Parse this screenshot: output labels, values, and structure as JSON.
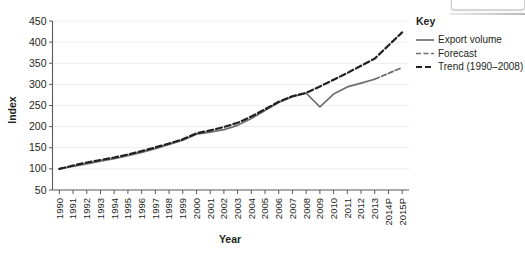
{
  "chart_data": {
    "type": "line",
    "title": "",
    "xlabel": "Year",
    "ylabel": "Index",
    "ylim": [
      50,
      450
    ],
    "yticks": [
      50,
      100,
      150,
      200,
      250,
      300,
      350,
      400,
      450
    ],
    "grid": true,
    "legend_position": "right",
    "legend_title": "Key",
    "categories": [
      "1990",
      "1991",
      "1992",
      "1993",
      "1994",
      "1995",
      "1996",
      "1997",
      "1998",
      "1999",
      "2000",
      "2001",
      "2002",
      "2003",
      "2004",
      "2005",
      "2006",
      "2007",
      "2008",
      "2009",
      "2010",
      "2011",
      "2012",
      "2013",
      "2014P",
      "2015P"
    ],
    "series": [
      {
        "name": "Export volume",
        "style": "solid",
        "color": "#6d6e71",
        "values": [
          100,
          106,
          112,
          118,
          124,
          131,
          139,
          148,
          158,
          168,
          182,
          187,
          193,
          203,
          219,
          238,
          257,
          271,
          279,
          247,
          277,
          294,
          303,
          312,
          null,
          null
        ]
      },
      {
        "name": "Forecast",
        "style": "dash-dot",
        "color": "#6d6e71",
        "values": [
          null,
          null,
          null,
          null,
          null,
          null,
          null,
          null,
          null,
          null,
          null,
          null,
          null,
          null,
          null,
          null,
          null,
          null,
          null,
          null,
          null,
          null,
          null,
          312,
          326,
          340
        ]
      },
      {
        "name": "Trend (1990–2008)",
        "style": "dash-dot-bold",
        "color": "#231f20",
        "values": [
          100,
          108,
          115,
          121,
          127,
          134,
          142,
          151,
          160,
          170,
          184,
          191,
          199,
          209,
          224,
          241,
          259,
          272,
          280,
          295,
          311,
          327,
          344,
          361,
          392,
          423
        ]
      }
    ]
  },
  "legend": {
    "title": "Key",
    "items": [
      {
        "label": "Export volume",
        "style": "solid"
      },
      {
        "label": "Forecast",
        "style": "dash-dot"
      },
      {
        "label": "Trend (1990–2008)",
        "style": "dash-dot-bold"
      }
    ]
  },
  "axes": {
    "y_title": "Index",
    "x_title": "Year"
  }
}
